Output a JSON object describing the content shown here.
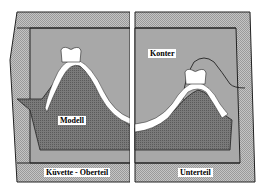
{
  "diagram": {
    "type": "cross-section",
    "colors": {
      "background": "#ffffff",
      "rim_hatch": "#b8b8b8",
      "fill_gray": "#a9a9a9",
      "dark_fill": "#6e6e6e",
      "tooth_white": "#ffffff",
      "outline": "#222222"
    },
    "panels": [
      {
        "id": "left",
        "caption": "Küvette - Oberteil"
      },
      {
        "id": "right",
        "caption": "Unterteil"
      }
    ],
    "labels": {
      "modell": "Modell",
      "konter": "Konter",
      "oberteil": "Küvette - Oberteil",
      "unterteil": "Unterteil"
    }
  }
}
